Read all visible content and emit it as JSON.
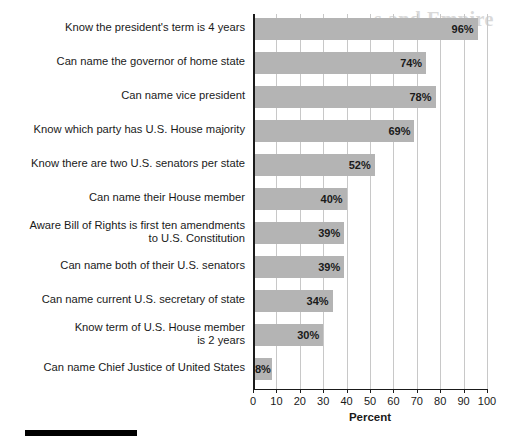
{
  "ghost_text": "s and Empire",
  "chart_data": {
    "type": "bar",
    "orientation": "horizontal",
    "title": "",
    "xlabel": "Percent",
    "ylabel": "",
    "xlim": [
      0,
      100
    ],
    "xticks": [
      0,
      10,
      20,
      30,
      40,
      50,
      60,
      70,
      80,
      90,
      100
    ],
    "grid": "vertical",
    "legend": "none",
    "bar_color": "#b4b4b4",
    "axis_color": "#1a1a1a",
    "gridline_color": "#c8c8c8",
    "categories": [
      "Know the president's term is 4 years",
      "Can name the governor of home state",
      "Can name vice president",
      "Know which party has U.S. House majority",
      "Know there are two U.S. senators per state",
      "Can name their House member",
      "Aware Bill of Rights is first ten amendments\nto U.S. Constitution",
      "Can name both of their U.S. senators",
      "Can name current U.S. secretary of state",
      "Know term of U.S. House member\nis 2 years",
      "Can name Chief Justice of United States"
    ],
    "values": [
      96,
      74,
      78,
      69,
      52,
      40,
      39,
      39,
      34,
      30,
      8
    ],
    "data_labels": [
      "96%",
      "74%",
      "78%",
      "69%",
      "52%",
      "40%",
      "39%",
      "39%",
      "34%",
      "30%",
      "8%"
    ]
  }
}
